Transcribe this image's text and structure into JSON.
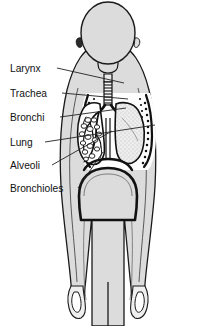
{
  "diagram": {
    "background_color": "#ffffff",
    "body_fill_color": "#dcdcdc",
    "outline_color": "#1a1a1a",
    "lung_fill_color": "#ebebeb",
    "leader_line_color": "#222222",
    "text_color": "#111111"
  },
  "labels": [
    {
      "id": "larynx",
      "text": "Larynx",
      "text_x": 10,
      "text_y": 72,
      "leader_from_x": 57,
      "leader_from_y": 68,
      "leader_to_x": 124,
      "leader_to_y": 83
    },
    {
      "id": "trachea",
      "text": "Trachea",
      "text_x": 10,
      "text_y": 97,
      "leader_from_x": 62,
      "leader_from_y": 93,
      "leader_to_x": 128,
      "leader_to_y": 99
    },
    {
      "id": "bronchi",
      "text": "Bronchi",
      "text_x": 10,
      "text_y": 121,
      "leader_from_x": 60,
      "leader_from_y": 117,
      "leader_to_x": 126,
      "leader_to_y": 108
    },
    {
      "id": "lung",
      "text": "Lung",
      "text_x": 10,
      "text_y": 146,
      "leader_from_x": 45,
      "leader_from_y": 142,
      "leader_to_x": 155,
      "leader_to_y": 125
    },
    {
      "id": "alveoli",
      "text": "Alveoli",
      "text_x": 10,
      "text_y": 169,
      "leader_from_x": 52,
      "leader_from_y": 165,
      "leader_to_x": 112,
      "leader_to_y": 131
    },
    {
      "id": "bronchioles",
      "text": "Bronchioles",
      "text_x": 10,
      "text_y": 192,
      "leader_from_x": 78,
      "leader_from_y": 188,
      "leader_to_x": 103,
      "leader_to_y": 152
    }
  ]
}
